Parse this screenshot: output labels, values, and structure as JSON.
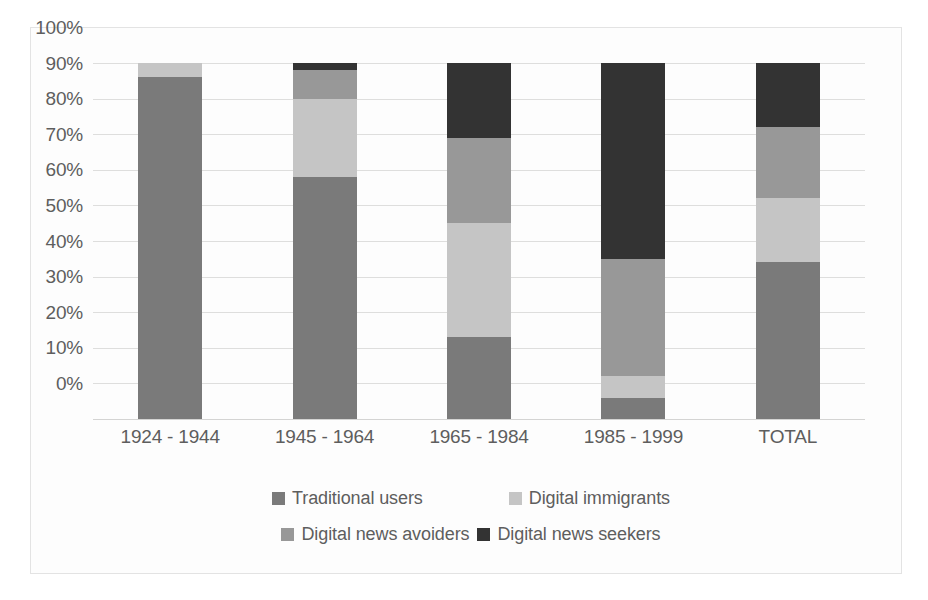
{
  "chart_data": {
    "type": "bar",
    "subtype": "stacked-bar-100-percent",
    "title": "",
    "subtitle": "",
    "xlabel": "",
    "ylabel": "",
    "categories": [
      "1924 - 1944",
      "1945 - 1964",
      "1965 - 1984",
      "1985 - 1999",
      "TOTAL"
    ],
    "series": [
      {
        "name": "Traditional users",
        "color": "#7a7a7a",
        "values": [
          96,
          68,
          23,
          6,
          44
        ]
      },
      {
        "name": "Digital immigrants",
        "color": "#c5c5c5",
        "values": [
          4,
          22,
          32,
          6,
          18
        ]
      },
      {
        "name": "Digital news avoiders",
        "color": "#989898",
        "values": [
          0,
          8,
          24,
          33,
          20
        ]
      },
      {
        "name": "Digital news seekers",
        "color": "#333333",
        "values": [
          0,
          2,
          21,
          55,
          18
        ]
      }
    ],
    "stack_order_bottom_to_top": [
      "Traditional users",
      "Digital immigrants",
      "Digital news avoiders",
      "Digital news seekers"
    ],
    "ylim": [
      0,
      100
    ],
    "y_tick_labels": [
      "100%",
      "90%",
      "80%",
      "70%",
      "60%",
      "50%",
      "40%",
      "30%",
      "20%",
      "10%",
      "0%"
    ],
    "y_tick_values": [
      100,
      90,
      80,
      70,
      60,
      50,
      40,
      30,
      20,
      10,
      0
    ],
    "y_unit": "%",
    "grid": true,
    "grid_axis": "y",
    "legend_position": "bottom",
    "legend_entries": [
      {
        "label": "Traditional users",
        "color": "#7a7a7a"
      },
      {
        "label": "Digital immigrants",
        "color": "#c5c5c5"
      },
      {
        "label": "Digital news avoiders",
        "color": "#989898"
      },
      {
        "label": "Digital news seekers",
        "color": "#333333"
      }
    ],
    "annotations": []
  },
  "colors": {
    "traditional_users": "#7a7a7a",
    "digital_immigrants": "#c5c5c5",
    "digital_news_avoiders": "#989898",
    "digital_news_seekers": "#333333",
    "gridline": "#dededd",
    "axis_text": "#5e5e5e",
    "frame_border": "#e3e3e3",
    "plot_background": "#fdfdfd"
  }
}
